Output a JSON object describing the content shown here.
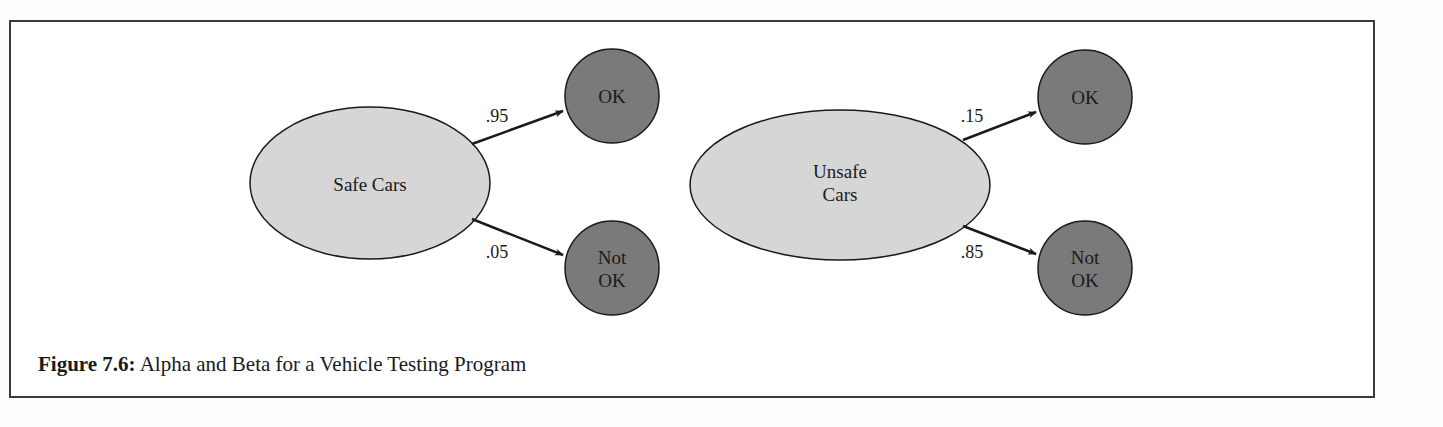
{
  "figure": {
    "caption_label": "Figure 7.6:",
    "caption_text": " Alpha and Beta for a Vehicle Testing Program"
  },
  "colors": {
    "source_fill": "#d6d6d6",
    "outcome_fill": "#7a7a7a",
    "stroke": "#1a1a1a"
  },
  "diagrams": [
    {
      "source": {
        "label_lines": [
          "Safe Cars"
        ]
      },
      "edges": [
        {
          "probability": ".95",
          "target": [
            "OK"
          ]
        },
        {
          "probability": ".05",
          "target": [
            "Not",
            "OK"
          ]
        }
      ]
    },
    {
      "source": {
        "label_lines": [
          "Unsafe",
          "Cars"
        ]
      },
      "edges": [
        {
          "probability": ".15",
          "target": [
            "OK"
          ]
        },
        {
          "probability": ".85",
          "target": [
            "Not",
            "OK"
          ]
        }
      ]
    }
  ]
}
